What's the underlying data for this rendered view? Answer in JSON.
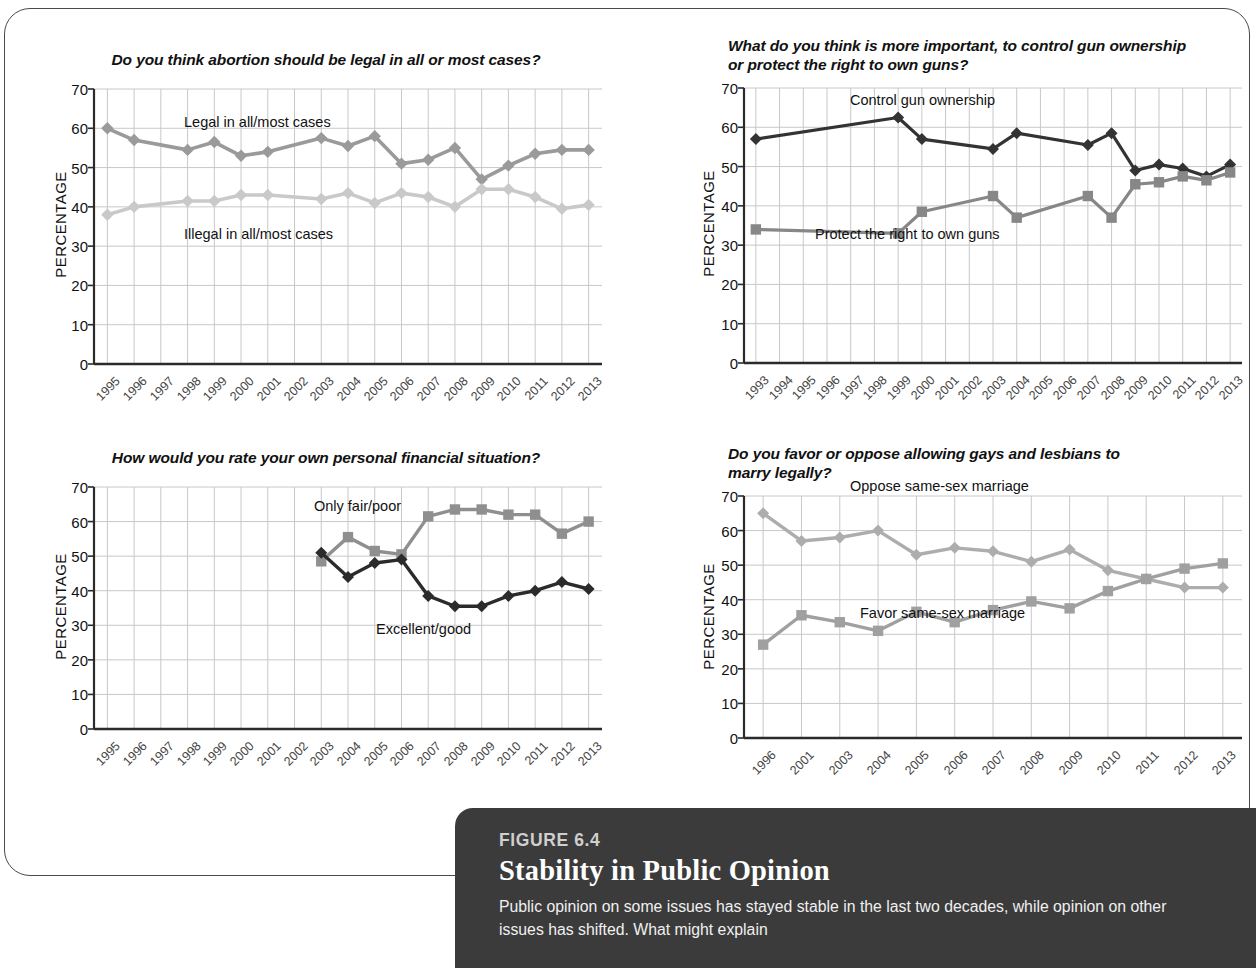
{
  "figure": {
    "number_label": "FIGURE 6.4",
    "title": "Stability in Public Opinion",
    "body": "Public opinion on some issues has stayed stable in the last two decades, while opinion on other issues has shifted. What might explain"
  },
  "axis": {
    "ylabel": "PERCENTAGE",
    "yticks": [
      "70",
      "60",
      "50",
      "40",
      "30",
      "20",
      "10",
      "0"
    ]
  },
  "chart_data": [
    {
      "id": "abortion",
      "type": "line",
      "title": "Do you think abortion should be legal in all or most cases?",
      "xlabel": "",
      "ylabel": "PERCENTAGE",
      "ylim": [
        0,
        70
      ],
      "grid": true,
      "legend_position": "inline-annotation",
      "categories": [
        "1995",
        "1996",
        "1997",
        "1998",
        "1999",
        "2000",
        "2001",
        "2002",
        "2003",
        "2004",
        "2005",
        "2006",
        "2007",
        "2008",
        "2009",
        "2010",
        "2011",
        "2012",
        "2013"
      ],
      "series": [
        {
          "name": "Legal in all/most cases",
          "color": "#9a9a9a",
          "marker": "diamond",
          "x": [
            "1995",
            "1996",
            "1998",
            "1999",
            "2000",
            "2001",
            "2003",
            "2004",
            "2005",
            "2006",
            "2007",
            "2008",
            "2009",
            "2010",
            "2011",
            "2012",
            "2013"
          ],
          "values": [
            60,
            57,
            54.5,
            56.5,
            53,
            54,
            57.5,
            55.5,
            58,
            51,
            52,
            55,
            47,
            50.5,
            53.5,
            54.5,
            54.5
          ]
        },
        {
          "name": "Illegal in all/most cases",
          "color": "#c9c9c9",
          "marker": "diamond",
          "x": [
            "1995",
            "1996",
            "1998",
            "1999",
            "2000",
            "2001",
            "2003",
            "2004",
            "2005",
            "2006",
            "2007",
            "2008",
            "2009",
            "2010",
            "2011",
            "2012",
            "2013"
          ],
          "values": [
            38,
            40,
            41.5,
            41.5,
            43,
            43,
            42,
            43.5,
            41,
            43.5,
            42.5,
            40,
            44.5,
            44.5,
            42.5,
            39.5,
            40.5
          ]
        }
      ]
    },
    {
      "id": "guns",
      "type": "line",
      "title": "What do you think is more important, to control gun ownership or protect the right to own guns?",
      "xlabel": "",
      "ylabel": "PERCENTAGE",
      "ylim": [
        0,
        70
      ],
      "grid": true,
      "legend_position": "inline-annotation",
      "categories": [
        "1993",
        "1994",
        "1995",
        "1996",
        "1997",
        "1998",
        "1999",
        "2000",
        "2001",
        "2002",
        "2003",
        "2004",
        "2005",
        "2006",
        "2007",
        "2008",
        "2009",
        "2010",
        "2011",
        "2012",
        "2013"
      ],
      "series": [
        {
          "name": "Control gun ownership",
          "color": "#333333",
          "marker": "diamond",
          "x": [
            "1993",
            "1999",
            "2000",
            "2003",
            "2004",
            "2007",
            "2008",
            "2009",
            "2010",
            "2011",
            "2012",
            "2013"
          ],
          "values": [
            57,
            62.5,
            57,
            54.5,
            58.5,
            55.5,
            58.5,
            49,
            50.5,
            49.5,
            47.5,
            50.5
          ]
        },
        {
          "name": "Protect the right to own guns",
          "color": "#878787",
          "marker": "square",
          "x": [
            "1993",
            "1999",
            "2000",
            "2003",
            "2004",
            "2007",
            "2008",
            "2009",
            "2010",
            "2011",
            "2012",
            "2013"
          ],
          "values": [
            34,
            33,
            38.5,
            42.5,
            37,
            42.5,
            37,
            45.5,
            46,
            47.5,
            46.5,
            48.5
          ]
        }
      ]
    },
    {
      "id": "finances",
      "type": "line",
      "title": "How would you rate your own personal financial situation?",
      "xlabel": "",
      "ylabel": "PERCENTAGE",
      "ylim": [
        0,
        70
      ],
      "grid": true,
      "legend_position": "inline-annotation",
      "categories": [
        "1995",
        "1996",
        "1997",
        "1998",
        "1999",
        "2000",
        "2001",
        "2002",
        "2003",
        "2004",
        "2005",
        "2006",
        "2007",
        "2008",
        "2009",
        "2010",
        "2011",
        "2012",
        "2013"
      ],
      "series": [
        {
          "name": "Only fair/poor",
          "color": "#8f8f8f",
          "marker": "square",
          "x": [
            "2003",
            "2004",
            "2005",
            "2006",
            "2007",
            "2008",
            "2009",
            "2010",
            "2011",
            "2012",
            "2013"
          ],
          "values": [
            48.5,
            55.5,
            51.5,
            50.5,
            61.5,
            63.5,
            63.5,
            62,
            62,
            56.5,
            60
          ]
        },
        {
          "name": "Excellent/good",
          "color": "#2b2b2b",
          "marker": "diamond",
          "x": [
            "2003",
            "2004",
            "2005",
            "2006",
            "2007",
            "2008",
            "2009",
            "2010",
            "2011",
            "2012",
            "2013"
          ],
          "values": [
            51,
            44,
            48,
            49,
            38.5,
            35.5,
            35.5,
            38.5,
            40,
            42.5,
            40.5
          ]
        }
      ]
    },
    {
      "id": "marriage",
      "type": "line",
      "title": "Do you favor or oppose allowing gays and lesbians to marry legally?",
      "xlabel": "",
      "ylabel": "PERCENTAGE",
      "ylim": [
        0,
        70
      ],
      "grid": true,
      "legend_position": "inline-annotation",
      "categories": [
        "1996",
        "2001",
        "2003",
        "2004",
        "2005",
        "2006",
        "2007",
        "2008",
        "2009",
        "2010",
        "2011",
        "2012",
        "2013"
      ],
      "series": [
        {
          "name": "Oppose same-sex marriage",
          "color": "#adadad",
          "marker": "diamond",
          "x": [
            "1996",
            "2001",
            "2003",
            "2004",
            "2005",
            "2006",
            "2007",
            "2008",
            "2009",
            "2010",
            "2011",
            "2012",
            "2013"
          ],
          "values": [
            65,
            57,
            58,
            60,
            53,
            55,
            54,
            51,
            54.5,
            48.5,
            46,
            43.5,
            43.5
          ]
        },
        {
          "name": "Favor same-sex marriage",
          "color": "#a0a0a0",
          "marker": "square",
          "x": [
            "1996",
            "2001",
            "2003",
            "2004",
            "2005",
            "2006",
            "2007",
            "2008",
            "2009",
            "2010",
            "2011",
            "2012",
            "2013"
          ],
          "values": [
            27,
            35.5,
            33.5,
            31,
            36.5,
            33.5,
            37,
            39.5,
            37.5,
            42.5,
            46,
            49,
            50.5
          ]
        }
      ]
    }
  ]
}
